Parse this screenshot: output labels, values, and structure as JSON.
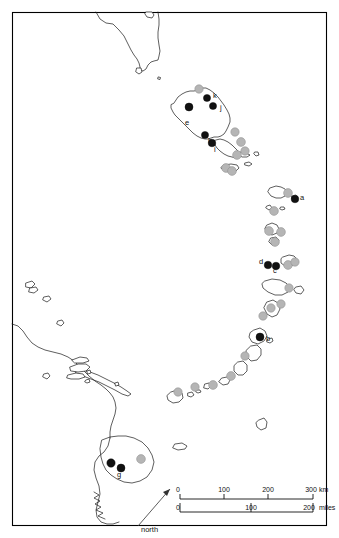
{
  "figure": {
    "width": 339,
    "height": 538,
    "background_color": "#ffffff",
    "frame_color": "#000000"
  },
  "legend_colors": {
    "occupied_site": "#111111",
    "unoccupied_site": "#b5b5b5",
    "coastline": "#1a1a1a"
  },
  "site_labels": [
    {
      "id": "a",
      "text": "a",
      "x": 300,
      "y": 200
    },
    {
      "id": "b",
      "text": "b",
      "x": 266,
      "y": 341
    },
    {
      "id": "c",
      "text": "c",
      "x": 273,
      "y": 273
    },
    {
      "id": "d",
      "text": "d",
      "x": 259,
      "y": 264
    },
    {
      "id": "e",
      "text": "e",
      "x": 185,
      "y": 125
    },
    {
      "id": "g",
      "text": "g",
      "x": 117,
      "y": 477
    },
    {
      "id": "h",
      "text": "h",
      "x": 208,
      "y": 143
    },
    {
      "id": "i",
      "text": "i",
      "x": 214,
      "y": 152
    },
    {
      "id": "j",
      "text": "j",
      "x": 220,
      "y": 110
    },
    {
      "id": "k",
      "text": "k",
      "x": 213,
      "y": 98
    }
  ],
  "black_dots": [
    {
      "x": 189,
      "y": 107,
      "r": 4.0
    },
    {
      "x": 207,
      "y": 98,
      "r": 3.6
    },
    {
      "x": 213,
      "y": 106,
      "r": 3.6
    },
    {
      "x": 205,
      "y": 135,
      "r": 3.6
    },
    {
      "x": 212,
      "y": 143,
      "r": 3.8
    },
    {
      "x": 295,
      "y": 199,
      "r": 3.8
    },
    {
      "x": 268,
      "y": 265,
      "r": 3.8
    },
    {
      "x": 276,
      "y": 266,
      "r": 3.8
    },
    {
      "x": 260,
      "y": 337,
      "r": 4.0
    },
    {
      "x": 111,
      "y": 463,
      "r": 4.2
    },
    {
      "x": 121,
      "y": 468,
      "r": 4.0
    }
  ],
  "gray_dots": [
    {
      "x": 199,
      "y": 89,
      "r": 4.2
    },
    {
      "x": 235,
      "y": 132,
      "r": 4.2
    },
    {
      "x": 241,
      "y": 142,
      "r": 4.4
    },
    {
      "x": 245,
      "y": 151,
      "r": 4.2
    },
    {
      "x": 237,
      "y": 155,
      "r": 4.4
    },
    {
      "x": 226,
      "y": 168,
      "r": 4.4
    },
    {
      "x": 232,
      "y": 171,
      "r": 4.4
    },
    {
      "x": 288,
      "y": 193,
      "r": 4.4
    },
    {
      "x": 274,
      "y": 211,
      "r": 4.4
    },
    {
      "x": 269,
      "y": 231,
      "r": 4.4
    },
    {
      "x": 281,
      "y": 232,
      "r": 4.4
    },
    {
      "x": 275,
      "y": 242,
      "r": 4.4
    },
    {
      "x": 288,
      "y": 265,
      "r": 4.4
    },
    {
      "x": 295,
      "y": 262,
      "r": 4.2
    },
    {
      "x": 289,
      "y": 288,
      "r": 4.2
    },
    {
      "x": 281,
      "y": 304,
      "r": 4.2
    },
    {
      "x": 271,
      "y": 308,
      "r": 4.2
    },
    {
      "x": 263,
      "y": 316,
      "r": 4.2
    },
    {
      "x": 245,
      "y": 356,
      "r": 4.2
    },
    {
      "x": 231,
      "y": 376,
      "r": 4.4
    },
    {
      "x": 213,
      "y": 385,
      "r": 4.4
    },
    {
      "x": 195,
      "y": 387,
      "r": 4.2
    },
    {
      "x": 178,
      "y": 392,
      "r": 4.2
    },
    {
      "x": 141,
      "y": 459,
      "r": 4.4
    }
  ],
  "scale_bar": {
    "km": {
      "unit_label": "km",
      "ticks": [
        "0",
        "100",
        "200",
        "300"
      ]
    },
    "miles": {
      "unit_label": "miles",
      "ticks": [
        "0",
        "100",
        "200"
      ]
    }
  },
  "north_arrow": {
    "label": "north"
  }
}
